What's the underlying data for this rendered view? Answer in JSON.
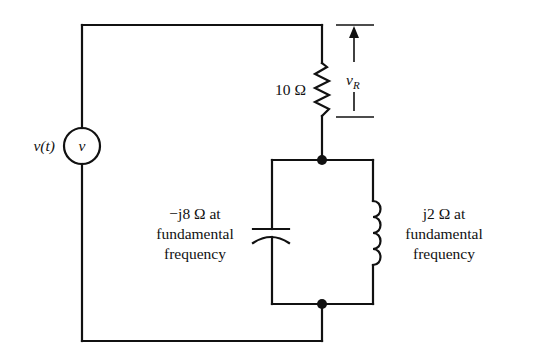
{
  "diagram": {
    "type": "circuit-schematic",
    "colors": {
      "ink": "#111111",
      "background": "#ffffff"
    },
    "source": {
      "name_label": "v(t)",
      "symbol_label": "v"
    },
    "resistor": {
      "label": "10 Ω",
      "voltage_label": "v",
      "voltage_subscript": "R"
    },
    "capacitor": {
      "label_line1": "−j8 Ω at",
      "label_line2": "fundamental",
      "label_line3": "frequency"
    },
    "inductor": {
      "label_line1": "j2 Ω at",
      "label_line2": "fundamental",
      "label_line3": "frequency"
    }
  }
}
